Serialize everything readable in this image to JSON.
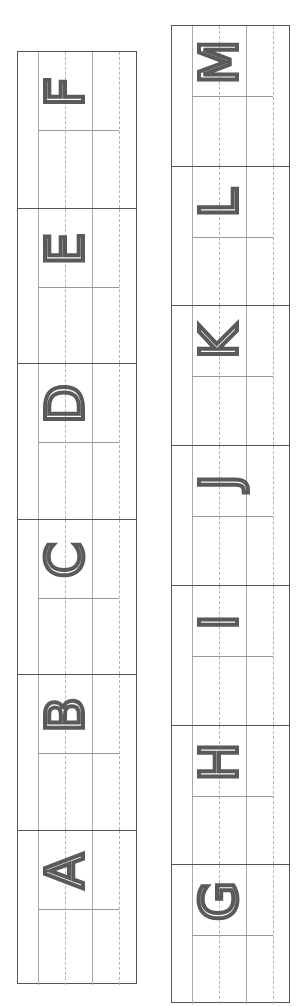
{
  "worksheet": {
    "left_column": {
      "letters": [
        "F",
        "E",
        "D",
        "C",
        "B",
        "A"
      ]
    },
    "right_column": {
      "letters": [
        "M",
        "L",
        "K",
        "J",
        "I",
        "H",
        "G"
      ]
    },
    "colors": {
      "border": "#555555",
      "guide_line": "#aaaaaa",
      "letter": "#5a5a5a"
    }
  }
}
